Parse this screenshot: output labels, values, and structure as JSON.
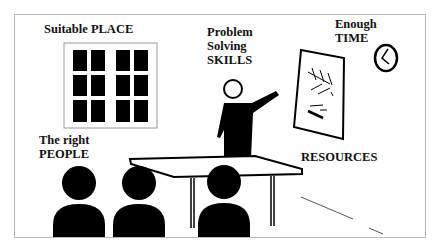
{
  "top_cut_text": "...  g ...  y",
  "labels": {
    "place": "Suitable PLACE",
    "skills_line1": "Problem",
    "skills_line2": "Solving",
    "skills_line3": "SKILLS",
    "time_line1": "Enough",
    "time_line2": "TIME",
    "people_line1": "The right",
    "people_line2": "PEOPLE",
    "resources": "RESOURCES"
  },
  "icons": [
    "window-icon",
    "presenter-icon",
    "whiteboard-icon",
    "clock-icon",
    "table-icon",
    "audience-person-icon"
  ],
  "colors": {
    "ink": "#000000",
    "frame_border": "#b9b9b9",
    "background": "#ffffff"
  }
}
